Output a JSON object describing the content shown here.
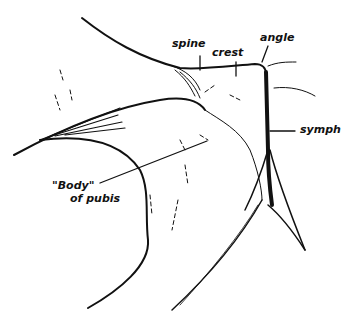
{
  "diagram": {
    "labels": {
      "spine": "spine",
      "crest": "crest",
      "angle": "angle",
      "symph": "symph",
      "body_line1": "\"Body\"",
      "body_line2": "of pubis"
    },
    "stroke_color": "#111111",
    "background_color": "#ffffff"
  }
}
